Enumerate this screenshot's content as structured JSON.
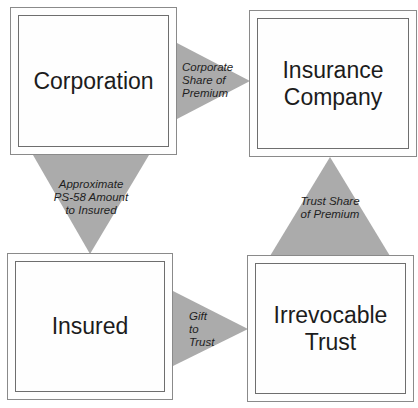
{
  "diagram": {
    "nodes": [
      {
        "id": "corporation",
        "label": "Corporation"
      },
      {
        "id": "insurance-company",
        "label": "Insurance\nCompany"
      },
      {
        "id": "insured",
        "label": "Insured"
      },
      {
        "id": "irrevocable-trust",
        "label": "Irrevocable\nTrust"
      }
    ],
    "edges": [
      {
        "from": "corporation",
        "to": "insurance-company",
        "label": "Corporate\nShare of\nPremium",
        "direction": "right"
      },
      {
        "from": "corporation",
        "to": "insured",
        "label": "Approximate\nPS-58 Amount\nto Insured",
        "direction": "down"
      },
      {
        "from": "insured",
        "to": "irrevocable-trust",
        "label": "Gift\nto\nTrust",
        "direction": "right"
      },
      {
        "from": "irrevocable-trust",
        "to": "insurance-company",
        "label": "Trust Share\nof Premium",
        "direction": "up"
      }
    ],
    "colors": {
      "arrow_fill": "#ababab",
      "box_border": "#7a7a7a",
      "background": "#ffffff"
    }
  }
}
